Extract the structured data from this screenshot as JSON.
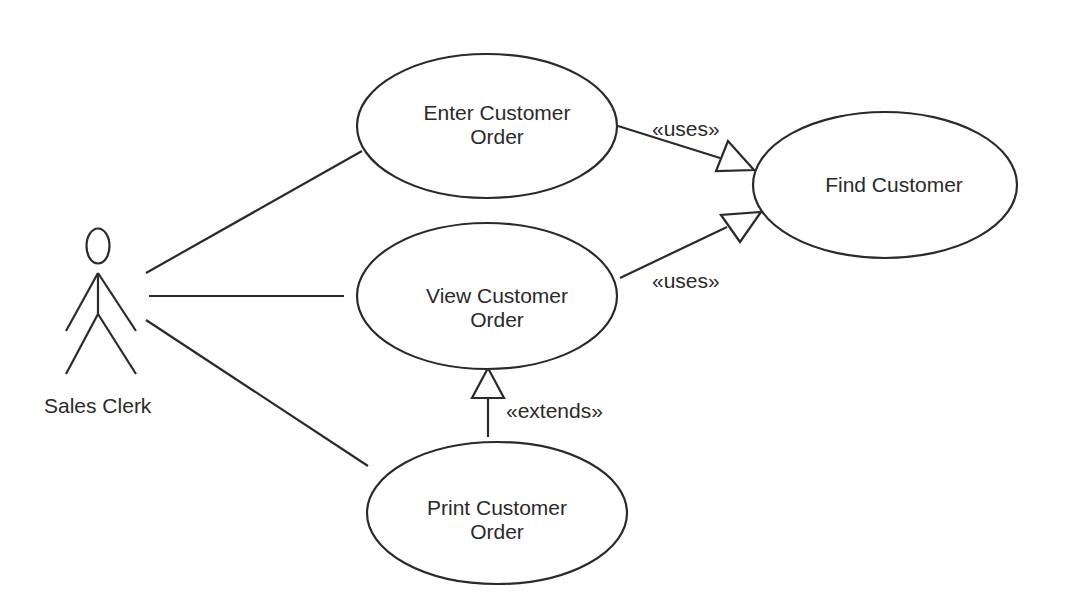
{
  "diagram": {
    "type": "uml-use-case",
    "actor": {
      "label": "Sales Clerk"
    },
    "use_cases": [
      {
        "id": "enter",
        "line1": "Enter Customer",
        "line2": "Order"
      },
      {
        "id": "view",
        "line1": "View Customer",
        "line2": "Order"
      },
      {
        "id": "print",
        "line1": "Print Customer",
        "line2": "Order"
      },
      {
        "id": "find",
        "line1": "Find Customer"
      }
    ],
    "relationships": [
      {
        "from": "enter",
        "to": "find",
        "label": "«uses»"
      },
      {
        "from": "view",
        "to": "find",
        "label": "«uses»"
      },
      {
        "from": "print",
        "to": "view",
        "label": "«extends»"
      }
    ],
    "associations": [
      {
        "from": "actor",
        "to": "enter"
      },
      {
        "from": "actor",
        "to": "view"
      },
      {
        "from": "actor",
        "to": "print"
      }
    ],
    "colors": {
      "line": "#2a2a2a",
      "background": "#ffffff"
    }
  }
}
